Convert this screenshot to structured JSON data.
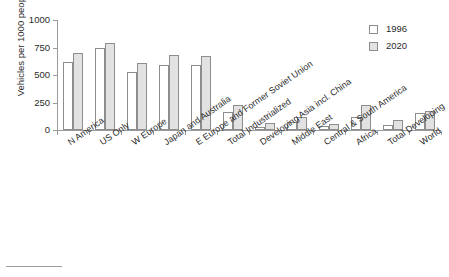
{
  "chart_data": {
    "type": "bar",
    "title": "",
    "subtitle": "",
    "xlabel": "",
    "ylabel": "Vehicles per 1000 people",
    "ylim": [
      0,
      1000
    ],
    "yticks": [
      0,
      250,
      500,
      750,
      1000
    ],
    "grid": false,
    "legend_position": "top-right",
    "categories": [
      "N America",
      "US Only",
      "W Europe",
      "Japan and Australia",
      "E Europe and Former Soviet Union",
      "Total Industrialized",
      "Developing Asia incl. China",
      "Middle East",
      "Central & South America",
      "Africa",
      "Total Developing",
      "World"
    ],
    "series": [
      {
        "name": "1996",
        "color": "#ffffff",
        "values": [
          620,
          745,
          525,
          590,
          590,
          165,
          30,
          75,
          35,
          120,
          50,
          155
        ]
      },
      {
        "name": "2020",
        "color": "#e2e2e2",
        "values": [
          700,
          790,
          610,
          680,
          670,
          225,
          60,
          120,
          55,
          225,
          95,
          170
        ]
      }
    ]
  },
  "legend": {
    "entries": [
      {
        "label": "1996",
        "swatch": "#ffffff"
      },
      {
        "label": "2020",
        "swatch": "#e2e2e2"
      }
    ]
  },
  "axes": {
    "y_title": "Vehicles per 1000 people",
    "y_tick_labels": [
      "1000",
      "750",
      "500",
      "250",
      "0"
    ]
  }
}
